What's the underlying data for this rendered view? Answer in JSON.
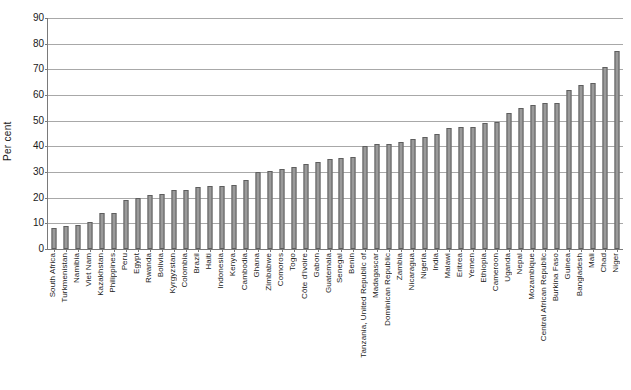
{
  "chart_data": {
    "type": "bar",
    "title": "",
    "xlabel": "",
    "ylabel": "Per cent",
    "ylim": [
      0,
      90
    ],
    "ytick_step": 10,
    "yticks": [
      0,
      10,
      20,
      30,
      40,
      50,
      60,
      70,
      80,
      90
    ],
    "grid": true,
    "legend": null,
    "orientation": "vertical",
    "bar_color": "#9a9a9a",
    "bar_border_color": "#5e5e5e",
    "categories": [
      "South Africa",
      "Turkmenistan",
      "Namibia",
      "Viet Nam",
      "Kazakhstan",
      "Philippines",
      "Peru",
      "Egypt",
      "Rwanda",
      "Bolivia",
      "Kyrgyzstan",
      "Colombia",
      "Brazil",
      "Haiti",
      "Indonesia",
      "Kenya",
      "Cambodia",
      "Ghana",
      "Zimbabwe",
      "Comoros",
      "Togo",
      "Côte d'Ivoire",
      "Gabon",
      "Guatemala",
      "Senegal",
      "Benin",
      "Tanzania, United Republic of",
      "Madagascar",
      "Dominican Republic",
      "Zambia",
      "Nicaragua",
      "Nigeria",
      "India",
      "Malawi",
      "Eritrea",
      "Yemen",
      "Ethiopia",
      "Cameroon",
      "Uganda",
      "Nepal",
      "Mozambique",
      "Central African Republic",
      "Burkina Faso",
      "Guinea",
      "Bangladesh",
      "Mali",
      "Chad",
      "Niger"
    ],
    "values": [
      8,
      9,
      9.5,
      10.5,
      14,
      14,
      19,
      20,
      21,
      21.5,
      23,
      23,
      24,
      24.5,
      24.5,
      25,
      27,
      30,
      30.5,
      31,
      32,
      33,
      34,
      35,
      35.5,
      36,
      40,
      41,
      41,
      41.5,
      43,
      43.5,
      45,
      47,
      47.5,
      47.5,
      49,
      49.5,
      53,
      55,
      56,
      57,
      57,
      62,
      64,
      64.5,
      71,
      77
    ],
    "tick_labels_x": [
      "South Africa",
      "Turkmenistan",
      "Namibia",
      "Viet Nam",
      "Kazakhstan",
      "Philippines",
      "Peru",
      "Egypt",
      "Rwanda",
      "Bolivia",
      "Kyrgyzstan",
      "Colombia",
      "Brazil",
      "Haiti",
      "Indonesia",
      "Kenya",
      "Cambodia",
      "Ghana",
      "Zimbabwe",
      "Comoros",
      "Togo",
      "Côte d'Ivoire",
      "Gabon",
      "Guatemala",
      "Senegal",
      "Benin",
      "Tanzania, United Republic of",
      "Madagascar",
      "Dominican Republic",
      "Zambia",
      "Nicaragua",
      "Nigeria",
      "India",
      "Malawi",
      "Eritrea",
      "Yemen",
      "Ethiopia",
      "Cameroon",
      "Uganda",
      "Nepal",
      "Mozambique",
      "Central African Republic",
      "Burkina Faso",
      "Guinea",
      "Bangladesh",
      "Mali",
      "Chad",
      "Niger"
    ]
  }
}
